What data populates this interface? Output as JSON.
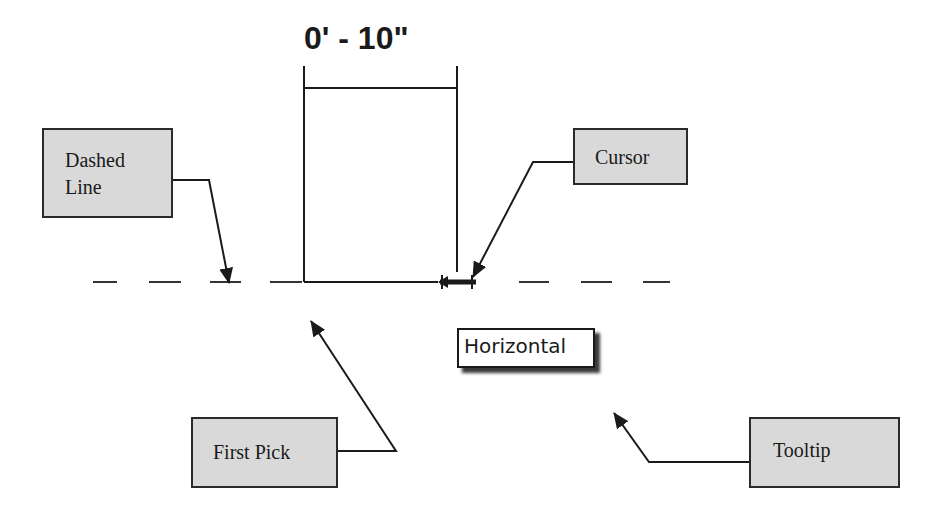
{
  "dimension": {
    "label": "0' - 10\""
  },
  "tooltip": {
    "label": "Horizontal"
  },
  "callouts": {
    "dashed_line": {
      "line1": "Dashed",
      "line2": "Line"
    },
    "cursor": {
      "label": "Cursor"
    },
    "first_pick": {
      "label": "First Pick"
    },
    "tooltip": {
      "label": "Tooltip"
    }
  },
  "colors": {
    "callout_fill": "#d9d9d9",
    "stroke": "#1a1a1a",
    "background": "#ffffff"
  }
}
